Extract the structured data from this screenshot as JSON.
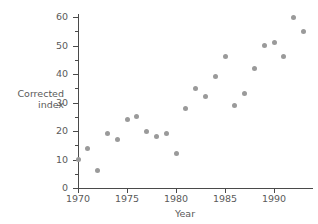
{
  "chart_data": {
    "type": "scatter",
    "title": "",
    "xlabel": "Year",
    "ylabel": "Corrected index",
    "ylabel_line1": "Corrected",
    "ylabel_line2": "index",
    "xlim": [
      1969,
      1994
    ],
    "ylim": [
      0,
      62
    ],
    "grid": false,
    "legend": null,
    "point_color": "#9a9a9a",
    "axis_color": "#4a4a4a",
    "background": "#ffffff",
    "x_ticks": [
      1970,
      1975,
      1980,
      1985,
      1990
    ],
    "x_tick_labels": [
      "1970",
      "1975",
      "1980",
      "1985",
      "1990"
    ],
    "y_ticks": [
      0,
      10,
      20,
      30,
      40,
      50,
      60
    ],
    "y_tick_labels": [
      "0",
      "10",
      "20",
      "30",
      "40",
      "50",
      "60"
    ],
    "y_minor_ticks": [
      5,
      15,
      25,
      35,
      45,
      55
    ],
    "x": [
      1970,
      1971,
      1972,
      1973,
      1974,
      1975,
      1976,
      1977,
      1978,
      1979,
      1980,
      1981,
      1982,
      1983,
      1984,
      1985,
      1986,
      1987,
      1988,
      1989,
      1990,
      1991,
      1992,
      1993
    ],
    "y": [
      10,
      14,
      6,
      19,
      17,
      24,
      25,
      20,
      18,
      19,
      12,
      28,
      35,
      32,
      39,
      46,
      29,
      33,
      42,
      50,
      51,
      46,
      60,
      55
    ],
    "points": [
      {
        "x": 1970,
        "y": 10
      },
      {
        "x": 1971,
        "y": 14
      },
      {
        "x": 1972,
        "y": 6
      },
      {
        "x": 1973,
        "y": 19
      },
      {
        "x": 1974,
        "y": 17
      },
      {
        "x": 1975,
        "y": 24
      },
      {
        "x": 1976,
        "y": 25
      },
      {
        "x": 1977,
        "y": 20
      },
      {
        "x": 1978,
        "y": 18
      },
      {
        "x": 1979,
        "y": 19
      },
      {
        "x": 1980,
        "y": 12
      },
      {
        "x": 1981,
        "y": 28
      },
      {
        "x": 1982,
        "y": 35
      },
      {
        "x": 1983,
        "y": 32
      },
      {
        "x": 1984,
        "y": 39
      },
      {
        "x": 1985,
        "y": 46
      },
      {
        "x": 1986,
        "y": 29
      },
      {
        "x": 1987,
        "y": 33
      },
      {
        "x": 1988,
        "y": 42
      },
      {
        "x": 1989,
        "y": 50
      },
      {
        "x": 1990,
        "y": 51
      },
      {
        "x": 1991,
        "y": 46
      },
      {
        "x": 1992,
        "y": 60
      },
      {
        "x": 1993,
        "y": 55
      }
    ]
  }
}
